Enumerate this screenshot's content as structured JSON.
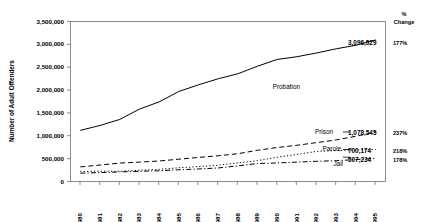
{
  "chart_data": {
    "type": "line",
    "title": "",
    "xlabel": "",
    "ylabel": "Number of Adult Offenders",
    "ylim": [
      0,
      3500000
    ],
    "ytick_labels": [
      "0",
      "500,000",
      "1,000,000",
      "1,500,000",
      "2,000,000",
      "2,500,000",
      "3,000,000",
      "3,500,000"
    ],
    "ytick_values": [
      0,
      500000,
      1000000,
      1500000,
      2000000,
      2500000,
      3000000,
      3500000
    ],
    "grid": false,
    "legend_position": "inline-right",
    "categories": [
      "1980",
      "1981",
      "1982",
      "1983",
      "1984",
      "1985",
      "1986",
      "1987",
      "1988",
      "1989",
      "1990",
      "1991",
      "1992",
      "1993",
      "1994",
      "1995"
    ],
    "x": [
      1980,
      1981,
      1982,
      1983,
      1984,
      1985,
      1986,
      1987,
      1988,
      1989,
      1990,
      1991,
      1992,
      1993,
      1994,
      1995
    ],
    "series": [
      {
        "name": "Probation",
        "style": "solid",
        "end_value_label": "3,096,529",
        "percent_change": "177%",
        "values": [
          1118097,
          1225934,
          1357264,
          1582947,
          1740948,
          1968712,
          2114621,
          2247158,
          2356483,
          2522125,
          2670234,
          2729322,
          2811611,
          2903061,
          2981022,
          3096529
        ]
      },
      {
        "name": "Prison",
        "style": "dashed",
        "end_value_label": "1,078,545",
        "percent_change": "237%",
        "values": [
          319598,
          360029,
          402914,
          423898,
          448264,
          487593,
          526436,
          562814,
          607766,
          683367,
          743382,
          792535,
          850566,
          909381,
          990147,
          1078545
        ]
      },
      {
        "name": "Parole",
        "style": "dotted",
        "end_value_label": "700,174",
        "percent_change": "218%",
        "values": [
          220438,
          225539,
          224604,
          246440,
          266992,
          300203,
          325638,
          355505,
          407977,
          456803,
          531407,
          590442,
          658601,
          676100,
          690371,
          700174
        ]
      },
      {
        "name": "Jail",
        "style": "dashdot",
        "end_value_label": "507,234",
        "percent_change": "178%",
        "values": [
          182288,
          195085,
          209582,
          223551,
          234500,
          256615,
          274444,
          295873,
          341893,
          393303,
          405320,
          424129,
          441781,
          455500,
          479800,
          507234
        ]
      }
    ]
  },
  "right_column": {
    "header_line1": "%",
    "header_line2": "Change"
  }
}
